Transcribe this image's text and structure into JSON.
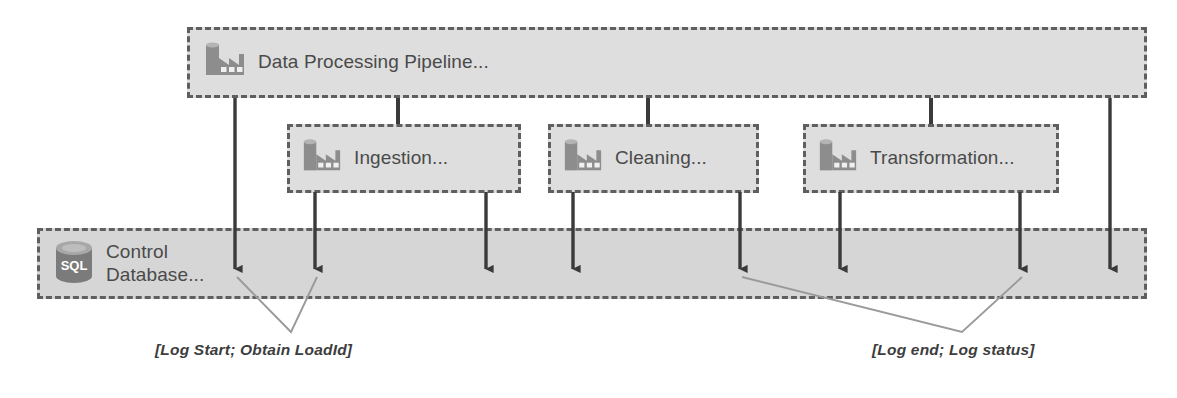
{
  "diagram": {
    "pipeline": {
      "label": "Data Processing Pipeline...",
      "icon": "factory-icon"
    },
    "stages": [
      {
        "id": "ingestion",
        "label": "Ingestion...",
        "icon": "factory-icon"
      },
      {
        "id": "cleaning",
        "label": "Cleaning...",
        "icon": "factory-icon"
      },
      {
        "id": "transformation",
        "label": "Transformation...",
        "icon": "factory-icon"
      }
    ],
    "control_database": {
      "label": "Control\nDatabase...",
      "icon": "sql-database-icon"
    },
    "annotations": [
      {
        "id": "log-start",
        "text": "[Log Start; Obtain LoadId]"
      },
      {
        "id": "log-end",
        "text": "[Log end; Log status]"
      }
    ],
    "colors": {
      "box_fill": "#dedede",
      "box_fill_control": "#d6d6d6",
      "box_border": "#5f5f5f",
      "icon_gray": "#8d8d8d",
      "icon_gray_dark": "#7b7b7b",
      "arrow": "#3a3a3a",
      "leader_line": "#9a9a9a",
      "text": "#4a4a4a",
      "annotation_text": "#3d3d3d",
      "background": "#ffffff"
    },
    "arrow_count": 8
  }
}
